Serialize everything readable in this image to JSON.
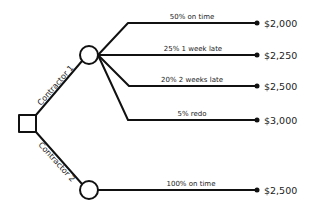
{
  "diagram": {
    "type": "decision-tree",
    "decision_node": {
      "shape": "square"
    },
    "options": [
      {
        "label": "Contractor 1",
        "outcomes": [
          {
            "label": "50% on time",
            "value": "$2,000"
          },
          {
            "label": "25% 1 week late",
            "value": "$2,250"
          },
          {
            "label": "20% 2 weeks late",
            "value": "$2,500"
          },
          {
            "label": "5% redo",
            "value": "$3,000"
          }
        ]
      },
      {
        "label": "Contractor 2",
        "outcomes": [
          {
            "label": "100% on time",
            "value": "$2,500"
          }
        ]
      }
    ],
    "colors": {
      "line": "#111111",
      "background": "#ffffff"
    }
  }
}
